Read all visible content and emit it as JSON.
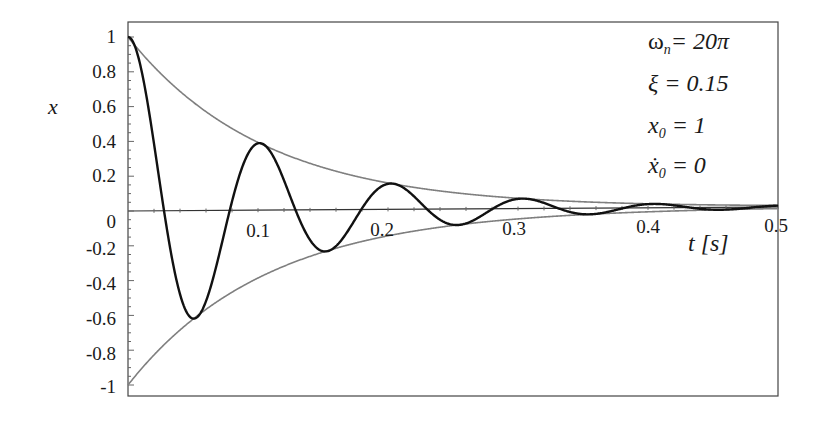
{
  "chart_data": {
    "type": "line",
    "title": "",
    "xlabel": "t [s]",
    "ylabel": "x",
    "xlim": [
      0,
      0.5
    ],
    "ylim": [
      -1,
      1
    ],
    "x_ticks": [
      "0.1",
      "0.2",
      "0.3",
      "0.4",
      "0.5"
    ],
    "y_ticks": [
      "1",
      "0.8",
      "0.6",
      "0.4",
      "0.2",
      "0",
      "-0.2",
      "-0.4",
      "-0.6",
      "-0.8",
      "-1"
    ],
    "grid": false,
    "legend": null,
    "parameters": {
      "omega_n": "20π",
      "xi": 0.15,
      "x0": 1,
      "xdot0": 0
    },
    "annotations": [
      "ωn = 20π",
      "ξ = 0.15",
      "x0 = 1",
      "ẋ0 = 0"
    ],
    "series": [
      {
        "name": "response x(t)",
        "color": "#111111",
        "description": "damped free vibration e^(-ξωn t)(cos ωd t + ξ/√(1-ξ²) sin ωd t)",
        "key_points": [
          {
            "t": 0.0,
            "x": 1.0
          },
          {
            "t": 0.05,
            "x": -0.61
          },
          {
            "t": 0.1,
            "x": 0.38
          },
          {
            "t": 0.15,
            "x": -0.23
          },
          {
            "t": 0.2,
            "x": 0.15
          },
          {
            "t": 0.25,
            "x": -0.09
          },
          {
            "t": 0.3,
            "x": 0.06
          },
          {
            "t": 0.35,
            "x": -0.03
          },
          {
            "t": 0.4,
            "x": 0.02
          },
          {
            "t": 0.5,
            "x": 0.01
          }
        ]
      },
      {
        "name": "upper envelope",
        "color": "#808080",
        "description": "+e^(-ξωn t)",
        "key_points": [
          {
            "t": 0.0,
            "x": 1.0
          },
          {
            "t": 0.1,
            "x": 0.39
          },
          {
            "t": 0.2,
            "x": 0.15
          },
          {
            "t": 0.3,
            "x": 0.06
          },
          {
            "t": 0.4,
            "x": 0.02
          },
          {
            "t": 0.5,
            "x": 0.01
          }
        ]
      },
      {
        "name": "lower envelope",
        "color": "#808080",
        "description": "-e^(-ξωn t)",
        "key_points": [
          {
            "t": 0.0,
            "x": -1.0
          },
          {
            "t": 0.1,
            "x": -0.39
          },
          {
            "t": 0.2,
            "x": -0.15
          },
          {
            "t": 0.3,
            "x": -0.06
          },
          {
            "t": 0.4,
            "x": -0.02
          },
          {
            "t": 0.5,
            "x": -0.01
          }
        ]
      }
    ]
  },
  "labels": {
    "y_axis": "x",
    "x_axis": "t [s]",
    "annot_omega_sym": "ω",
    "annot_omega_sub": "n",
    "annot_omega_val": "= 20π",
    "annot_xi": "ξ = 0.15",
    "annot_x0_sym": "x",
    "annot_x0_sub": "0",
    "annot_x0_val": " = 1",
    "annot_xdot_sym": "ẋ",
    "annot_xdot_sub": "0",
    "annot_xdot_val": " = 0"
  }
}
